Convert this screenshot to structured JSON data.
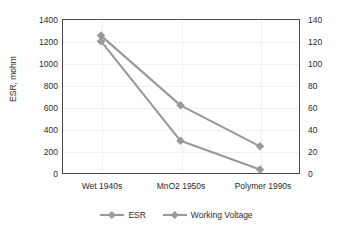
{
  "chart_data": {
    "type": "line",
    "title": "",
    "categories": [
      "Wet 1940s",
      "MnO2 1950s",
      "Polymer 1990s"
    ],
    "series": [
      {
        "name": "ESR",
        "axis": "left",
        "unit": "mohm",
        "values": [
          1250,
          620,
          250
        ],
        "color": "#999999",
        "marker": "diamond"
      },
      {
        "name": "Working Voltage",
        "axis": "right",
        "unit": "V",
        "values": [
          120,
          30,
          4
        ],
        "color": "#999999",
        "marker": "diamond"
      }
    ],
    "xlabel": "",
    "ylabel": "ESR, mohm",
    "y2label": "Working Voltage, V",
    "ylim": [
      0,
      1400
    ],
    "y2lim": [
      0,
      140
    ],
    "yticks": [
      0,
      200,
      400,
      600,
      800,
      1000,
      1200,
      1400
    ],
    "y2ticks": [
      0,
      20,
      40,
      60,
      80,
      100,
      120,
      140
    ],
    "grid": true,
    "legend_position": "bottom"
  },
  "axes": {
    "left_title": "ESR, mohm",
    "right_title": "Working Voltage, V",
    "left_ticks": [
      "0",
      "200",
      "400",
      "600",
      "800",
      "1000",
      "1200",
      "1400"
    ],
    "right_ticks": [
      "0",
      "20",
      "40",
      "60",
      "80",
      "100",
      "120",
      "140"
    ],
    "categories": [
      "Wet 1940s",
      "MnO2 1950s",
      "Polymer 1990s"
    ]
  },
  "legend": {
    "items": [
      {
        "label": "ESR"
      },
      {
        "label": "Working Voltage"
      }
    ]
  },
  "colors": {
    "series": "#999999",
    "frame": "#4a4a4a",
    "grid": "#f0f0f0",
    "text": "#2b2b2b"
  }
}
